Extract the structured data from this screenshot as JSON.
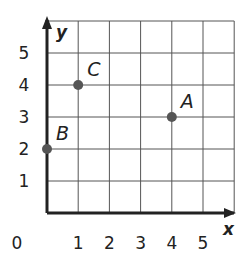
{
  "chart_data": {
    "type": "scatter",
    "title": "",
    "xlabel": "x",
    "ylabel": "y",
    "xlim": [
      0,
      6
    ],
    "ylim": [
      0,
      6
    ],
    "grid": true,
    "x_ticks": [
      "0",
      "1",
      "2",
      "3",
      "4",
      "5"
    ],
    "y_ticks": [
      "1",
      "2",
      "3",
      "4",
      "5"
    ],
    "points": [
      {
        "label": "A",
        "x": 4,
        "y": 3
      },
      {
        "label": "B",
        "x": 0,
        "y": 2
      },
      {
        "label": "C",
        "x": 1,
        "y": 4
      }
    ],
    "colors": {
      "grid": "#555555",
      "axis": "#222222",
      "point": "#555555"
    }
  }
}
